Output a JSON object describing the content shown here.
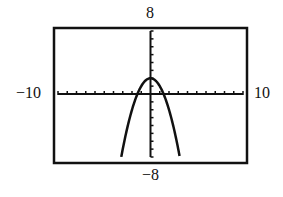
{
  "chart_data": {
    "type": "line",
    "title": "",
    "function": "y = 2 - x^2",
    "series": [
      {
        "name": "y = 2 - x^2",
        "x": [
          -3.16,
          -3,
          -2.5,
          -2,
          -1.5,
          -1,
          -0.5,
          0,
          0.5,
          1,
          1.5,
          2,
          2.5,
          3,
          3.16
        ],
        "values": [
          -8,
          -7,
          -4.25,
          -2,
          -0.25,
          1,
          1.75,
          2,
          1.75,
          1,
          -0.25,
          -2,
          -4.25,
          -7,
          -8
        ]
      }
    ],
    "xlim": [
      -10,
      10
    ],
    "ylim": [
      -8,
      8
    ],
    "xscale_ticks": 1,
    "yscale_ticks": 1,
    "labels": {
      "xmin": "−10",
      "xmax": "10",
      "ymin": "−8",
      "ymax": "8"
    },
    "grid": false
  }
}
